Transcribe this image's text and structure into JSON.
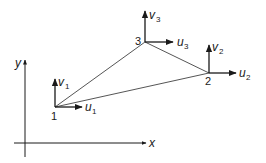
{
  "diagram": {
    "type": "triangular-element-nodal-dofs",
    "colors": {
      "line": "#1a1a1a",
      "background": "#ffffff"
    },
    "axes": {
      "x_label": "x",
      "y_label": "y"
    },
    "nodes": [
      {
        "id": "1",
        "label": "1",
        "u": "u",
        "u_sub": "1",
        "v": "v",
        "v_sub": "1"
      },
      {
        "id": "2",
        "label": "2",
        "u": "u",
        "u_sub": "2",
        "v": "v",
        "v_sub": "2"
      },
      {
        "id": "3",
        "label": "3",
        "u": "u",
        "u_sub": "3",
        "v": "v",
        "v_sub": "3"
      }
    ],
    "edges": [
      [
        "1",
        "2"
      ],
      [
        "2",
        "3"
      ],
      [
        "3",
        "1"
      ]
    ]
  }
}
